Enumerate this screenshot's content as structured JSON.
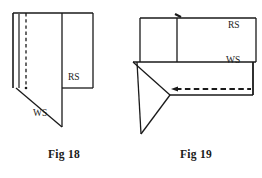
{
  "page": {
    "background_color": "#ffffff",
    "ink_color": "#1a1a1a",
    "width": 262,
    "height": 178
  },
  "figures": [
    {
      "id": "fig18",
      "caption": "Fig 18",
      "labels": [
        {
          "name": "right-side-label",
          "text": "RS"
        },
        {
          "name": "wrong-side-label",
          "text": "WS"
        }
      ],
      "description_elements": {
        "fold_edge": "double vertical line at left",
        "stitch_line": "vertical dashed line inside fold",
        "diagonal_edge": "bias diagonal from fold base to lower point"
      }
    },
    {
      "id": "fig19",
      "caption": "Fig 19",
      "labels": [
        {
          "name": "right-side-label",
          "text": "RS"
        },
        {
          "name": "wrong-side-label",
          "text": "WS"
        }
      ],
      "description_elements": {
        "notch_mark": "small tick at top centre",
        "stitch_arrow": "horizontal dashed line with left arrowhead",
        "triangle": "folded triangular flap at left"
      }
    }
  ],
  "captions": {
    "fig18": "Fig 18",
    "fig19": "Fig 19"
  },
  "labels": {
    "rs_18": "RS",
    "ws_18": "WS",
    "rs_19": "RS",
    "ws_19": "WS"
  }
}
